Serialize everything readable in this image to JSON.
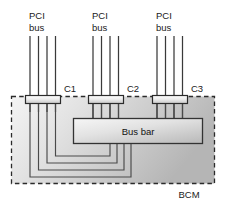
{
  "diagram": {
    "enclosure_label": "BCM",
    "bus_bar_label": "Bus bar",
    "pci_bus_groups": [
      {
        "id": "pci-bus-1",
        "line1": "PCI",
        "line2": "bus",
        "lanes": 4,
        "connector": "C1"
      },
      {
        "id": "pci-bus-2",
        "line1": "PCI",
        "line2": "bus",
        "lanes": 4,
        "connector": "C2"
      },
      {
        "id": "pci-bus-3",
        "line1": "PCI",
        "line2": "bus",
        "lanes": 4,
        "connector": "C3"
      }
    ],
    "connectors": [
      {
        "id": "C1",
        "label": "C1"
      },
      {
        "id": "C2",
        "label": "C2"
      },
      {
        "id": "C3",
        "label": "C3"
      }
    ],
    "colors": {
      "stroke": "#2b2b2b",
      "enclosure_fill_light": "#f2f2f2",
      "enclosure_fill_dark": "#b8b8b8",
      "busbar_fill_light": "#f4f4f4",
      "busbar_fill_dark": "#c2c2c2",
      "connector_fill": "#ededed",
      "page_background": "#ffffff",
      "text": "#1a1a1a"
    }
  }
}
